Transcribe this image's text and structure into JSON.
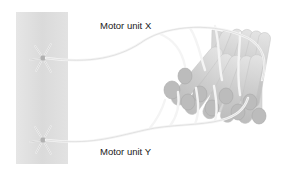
{
  "diagram": {
    "labels": {
      "motor_unit_x": "Motor unit X",
      "motor_unit_y": "Motor unit Y"
    },
    "parts": {
      "spinal_cord": "spinal-cord-strip",
      "neuron_x": "motor-neuron-x",
      "neuron_y": "motor-neuron-y",
      "muscle": "muscle-fiber-bundle"
    },
    "colors": {
      "background": "#ffffff",
      "spinal_cord": "#dcdcdc",
      "fiber_body": "#cfcfcf",
      "fiber_end": "#bdbdbd",
      "nerve": "#f2f2f2",
      "text": "#1a1a1a"
    }
  }
}
